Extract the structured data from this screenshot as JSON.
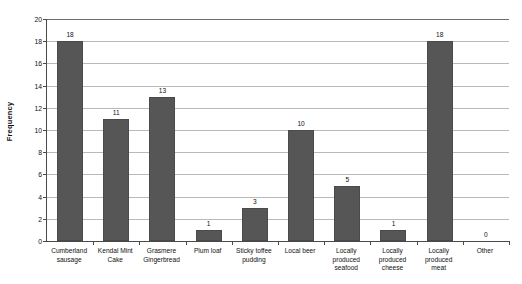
{
  "chart_data": {
    "type": "bar",
    "title": "",
    "xlabel": "",
    "ylabel": "Frequency",
    "ylim": [
      0,
      20
    ],
    "ytick_step": 2,
    "yticks": [
      0,
      2,
      4,
      6,
      8,
      10,
      12,
      14,
      16,
      18,
      20
    ],
    "grid": true,
    "legend": "none",
    "categories": [
      "Cumberland sausage",
      "Kendal Mint Cake",
      "Grasmere Gingerbread",
      "Plum loaf",
      "Sticky toffee pudding",
      "Local beer",
      "Locally produced seafood",
      "Locally produced cheese",
      "Locally produced meat",
      "Other"
    ],
    "category_lines": [
      [
        "Cumberland",
        "sausage"
      ],
      [
        "Kendal Mint",
        "Cake"
      ],
      [
        "Grasmere",
        "Gingerbread"
      ],
      [
        "Plum loaf"
      ],
      [
        "Sticky toffee",
        "pudding"
      ],
      [
        "Local beer"
      ],
      [
        "Locally",
        "produced",
        "seafood"
      ],
      [
        "Locally",
        "produced",
        "cheese"
      ],
      [
        "Locally",
        "produced",
        "meat"
      ],
      [
        "Other"
      ]
    ],
    "values": [
      18,
      11,
      13,
      1,
      3,
      10,
      5,
      1,
      18,
      0
    ],
    "value_labels": [
      "18",
      "11",
      "13",
      "1",
      "3",
      "10",
      "5",
      "1",
      "18",
      "0"
    ],
    "colors": {
      "bar_fill": "#565656",
      "bar_edge": "#4a4a4a",
      "gridline": "#b9b9b9",
      "axis": "#4a4a4a",
      "background": "#ffffff",
      "text": "#111111"
    }
  }
}
